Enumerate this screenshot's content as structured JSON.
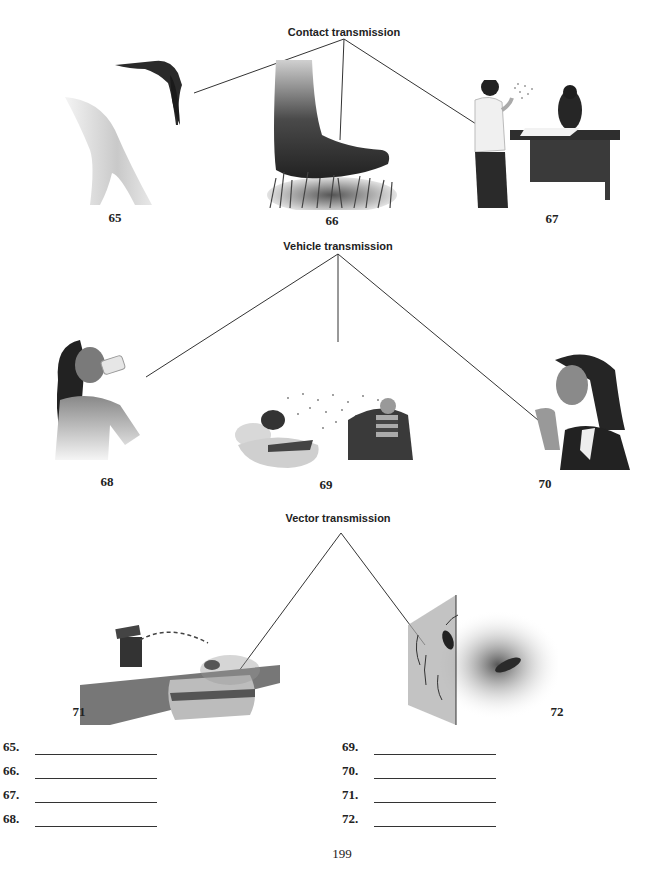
{
  "sections": [
    {
      "id": "contact",
      "heading": "Contact transmission",
      "items": [
        {
          "number": "65",
          "illustration": "bat-biting-shoulder"
        },
        {
          "number": "66",
          "illustration": "bare-foot-stepping-on-grass"
        },
        {
          "number": "67",
          "illustration": "man-sneezing-at-office-desk"
        }
      ]
    },
    {
      "id": "vehicle",
      "heading": "Vehicle transmission",
      "items": [
        {
          "number": "68",
          "illustration": "woman-drinking-from-cup"
        },
        {
          "number": "69",
          "illustration": "airborne-particles-between-two-people"
        },
        {
          "number": "70",
          "illustration": "woman-coughing-into-hand"
        }
      ]
    },
    {
      "id": "vector",
      "heading": "Vector transmission",
      "items": [
        {
          "number": "71",
          "illustration": "fly-from-trash-to-sandwich"
        },
        {
          "number": "72",
          "illustration": "cockroach-on-wall-and-floor"
        }
      ]
    }
  ],
  "answers": {
    "left": [
      {
        "number": "65.",
        "value": ""
      },
      {
        "number": "66.",
        "value": ""
      },
      {
        "number": "67.",
        "value": ""
      },
      {
        "number": "68.",
        "value": ""
      }
    ],
    "right": [
      {
        "number": "69.",
        "value": ""
      },
      {
        "number": "70.",
        "value": ""
      },
      {
        "number": "71.",
        "value": ""
      },
      {
        "number": "72.",
        "value": ""
      }
    ]
  },
  "page_number": "199"
}
